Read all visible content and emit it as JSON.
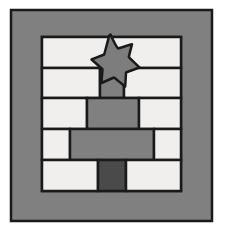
{
  "artwork": {
    "title": "Star Over Brick Wall Quilt Block",
    "kind": "quilt-block-illustration",
    "canvas": {
      "width": 225,
      "height": 233,
      "background": "#ffffff"
    },
    "palette": {
      "outline": "#1a1a1a",
      "frame_gray": "#808080",
      "sashing_gray": "#808080",
      "brick_light": "#f0efed",
      "brick_gray": "#808080",
      "brick_dark": "#4a4a4a",
      "star_fill": "#7d7d7d",
      "star_outline": "#1a1a1a",
      "background": "#ffffff"
    },
    "frame": {
      "name": "outer-frame",
      "x": 11,
      "y": 10,
      "width": 201,
      "height": 211,
      "fill": "#808080",
      "stroke": "#1a1a1a",
      "stroke_width": 2.5,
      "border_thickness_left": 31,
      "border_thickness_right": 31,
      "border_thickness_top": 27,
      "border_thickness_bottom": 30
    },
    "inner_field": {
      "name": "brick-field",
      "x": 42,
      "y": 37,
      "width": 139,
      "height": 154
    },
    "rows": [
      {
        "name": "brick-row-1",
        "index": 1,
        "y": 37,
        "height": 31,
        "bricks": [
          {
            "name": "brick-r1-c1",
            "x": 42,
            "width": 139,
            "fill": "#f0efed",
            "tone": "light"
          }
        ]
      },
      {
        "name": "brick-row-2",
        "index": 2,
        "y": 68,
        "height": 30,
        "bricks": [
          {
            "name": "brick-r2-c1",
            "x": 42,
            "width": 58,
            "fill": "#f0efed",
            "tone": "light"
          },
          {
            "name": "brick-r2-c2",
            "x": 100,
            "width": 24,
            "fill": "#808080",
            "tone": "gray"
          },
          {
            "name": "brick-r2-c3",
            "x": 124,
            "width": 57,
            "fill": "#f0efed",
            "tone": "light"
          }
        ]
      },
      {
        "name": "brick-row-3",
        "index": 3,
        "y": 98,
        "height": 31,
        "bricks": [
          {
            "name": "brick-r3-c1",
            "x": 42,
            "width": 45,
            "fill": "#f0efed",
            "tone": "light"
          },
          {
            "name": "brick-r3-c2",
            "x": 87,
            "width": 52,
            "fill": "#808080",
            "tone": "gray"
          },
          {
            "name": "brick-r3-c3",
            "x": 139,
            "width": 42,
            "fill": "#f0efed",
            "tone": "light"
          }
        ]
      },
      {
        "name": "brick-row-4",
        "index": 4,
        "y": 129,
        "height": 31,
        "bricks": [
          {
            "name": "brick-r4-c1",
            "x": 42,
            "width": 28,
            "fill": "#f0efed",
            "tone": "light"
          },
          {
            "name": "brick-r4-c2",
            "x": 70,
            "width": 84,
            "fill": "#808080",
            "tone": "gray"
          },
          {
            "name": "brick-r4-c3",
            "x": 154,
            "width": 27,
            "fill": "#f0efed",
            "tone": "light"
          }
        ]
      },
      {
        "name": "brick-row-5",
        "index": 5,
        "y": 160,
        "height": 31,
        "bricks": [
          {
            "name": "brick-r5-c1",
            "x": 42,
            "width": 56,
            "fill": "#f0efed",
            "tone": "light"
          },
          {
            "name": "brick-r5-c2",
            "x": 98,
            "width": 28,
            "fill": "#4a4a4a",
            "tone": "dark"
          },
          {
            "name": "brick-r5-c3",
            "x": 126,
            "width": 55,
            "fill": "#f0efed",
            "tone": "light"
          }
        ]
      }
    ],
    "star": {
      "name": "star-applique",
      "points": 5,
      "center_x": 110,
      "center_y": 57,
      "outer_radius": 23,
      "inner_radius": 9.5,
      "fill": "#7d7d7d",
      "stroke": "#1a1a1a",
      "stroke_width": 2.5,
      "path": "M110.5,34.5 C113,40 115.5,45.5 118,48.5 C121,47.5 127,45.5 132,44.2 C131,48.5 129.5,53.5 128.8,57.2 C131.5,60 136,64 139.5,67.5 C135,69.2 129.5,71 126,72.5 C125.8,76.5 125.5,82 125.2,86.5 C121.5,83.5 117,79.8 114,77.5 C110.5,79 105.5,81.2 101.5,83 C101.8,78.5 102.2,73 102.5,69.2 C99.5,66.5 95,62.5 91.5,59.5 C95.8,57.8 100.8,55.8 104.2,54.5 C105.5,49.5 107.8,41.5 109,36 Z"
    }
  }
}
